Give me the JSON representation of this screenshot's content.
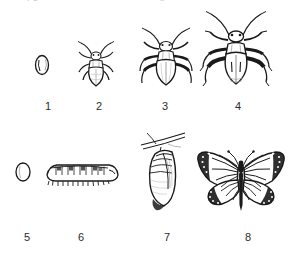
{
  "figure": {
    "background_color": "#ffffff",
    "ink_color": "#1a1a1a",
    "width": 307,
    "height": 261,
    "clipped_text_remnants": {
      "left": "y g",
      "middle": "p"
    },
    "rows": [
      {
        "row_name": "incomplete-metamorphosis",
        "stages": [
          {
            "number": "1",
            "icon": "insect-egg-oval-icon",
            "label_x": 38,
            "label_y": 100,
            "fig_x": 32,
            "fig_y": 52,
            "fig_w": 20,
            "fig_h": 26
          },
          {
            "number": "2",
            "icon": "insect-nymph-small-icon",
            "label_x": 89,
            "label_y": 100,
            "fig_x": 71,
            "fig_y": 37,
            "fig_w": 52,
            "fig_h": 56
          },
          {
            "number": "3",
            "icon": "insect-nymph-large-icon",
            "label_x": 155,
            "label_y": 100,
            "fig_x": 134,
            "fig_y": 25,
            "fig_w": 62,
            "fig_h": 70
          },
          {
            "number": "4",
            "icon": "insect-adult-bug-icon",
            "label_x": 228,
            "label_y": 100,
            "fig_x": 196,
            "fig_y": 12,
            "fig_w": 80,
            "fig_h": 84
          }
        ]
      },
      {
        "row_name": "complete-metamorphosis",
        "stages": [
          {
            "number": "5",
            "icon": "butterfly-egg-oval-icon",
            "label_x": 17,
            "label_y": 231,
            "fig_x": 14,
            "fig_y": 160,
            "fig_w": 18,
            "fig_h": 24
          },
          {
            "number": "6",
            "icon": "caterpillar-larva-icon",
            "label_x": 71,
            "label_y": 231,
            "fig_x": 44,
            "fig_y": 158,
            "fig_w": 74,
            "fig_h": 30
          },
          {
            "number": "7",
            "icon": "chrysalis-pupa-icon",
            "label_x": 157,
            "label_y": 231,
            "fig_x": 133,
            "fig_y": 132,
            "fig_w": 62,
            "fig_h": 90
          },
          {
            "number": "8",
            "icon": "monarch-butterfly-adult-icon",
            "label_x": 238,
            "label_y": 231,
            "fig_x": 193,
            "fig_y": 146,
            "fig_w": 96,
            "fig_h": 74
          }
        ]
      }
    ]
  }
}
